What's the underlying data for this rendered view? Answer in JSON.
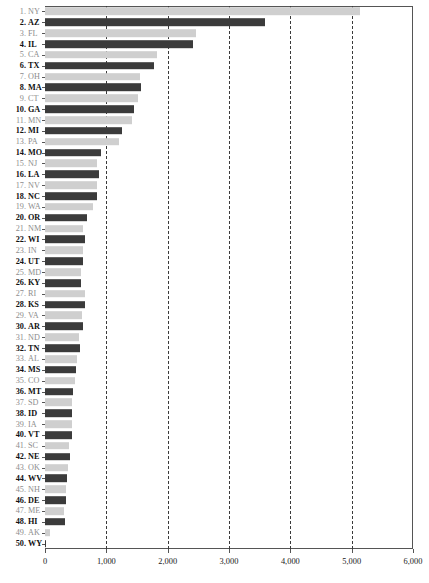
{
  "chart_data": {
    "type": "bar",
    "orientation": "horizontal",
    "title": "",
    "xlabel": "",
    "ylabel": "",
    "xlim": [
      0,
      6000
    ],
    "grid": true,
    "legend": null,
    "xticks": [
      0,
      1000,
      2000,
      3000,
      4000,
      5000,
      6000
    ],
    "xticklabels": [
      "0",
      "1,000",
      "2,000",
      "3,000",
      "4,000",
      "5,000",
      "6,000"
    ],
    "colors": {
      "dark_bar": "#3b3b3b",
      "light_bar": "#cfcfcf",
      "gridline": "#3a3a3a",
      "axis": "#555555",
      "bold_label": "#111111",
      "faint_label": "#8d8d8d"
    },
    "categories": [
      "NY",
      "AZ",
      "FL",
      "IL",
      "CA",
      "TX",
      "OH",
      "MA",
      "CT",
      "GA",
      "MN",
      "MI",
      "PA",
      "MO",
      "NJ",
      "LA",
      "NV",
      "NC",
      "WA",
      "OR",
      "NM",
      "WI",
      "IN",
      "UT",
      "MD",
      "KY",
      "RI",
      "KS",
      "VA",
      "AR",
      "ND",
      "TN",
      "AL",
      "MS",
      "CO",
      "MT",
      "SD",
      "ID",
      "IA",
      "VT",
      "SC",
      "NE",
      "OK",
      "WV",
      "NH",
      "DE",
      "ME",
      "HI",
      "AK",
      "WY"
    ],
    "ranks": [
      "1.",
      "2.",
      "3.",
      "4.",
      "5.",
      "6.",
      "7.",
      "8.",
      "9.",
      "10.",
      "11.",
      "12.",
      "13.",
      "14.",
      "15.",
      "16.",
      "17.",
      "18.",
      "19.",
      "20.",
      "21.",
      "22.",
      "23.",
      "24.",
      "25.",
      "26.",
      "27.",
      "28.",
      "29.",
      "30.",
      "31.",
      "32.",
      "33.",
      "34.",
      "35.",
      "36.",
      "37.",
      "38.",
      "39.",
      "40.",
      "41.",
      "42.",
      "43.",
      "44.",
      "45.",
      "46.",
      "47.",
      "48.",
      "49.",
      "50."
    ],
    "values": [
      5140,
      3590,
      2460,
      2420,
      1820,
      1770,
      1545,
      1565,
      1510,
      1450,
      1420,
      1250,
      1210,
      915,
      855,
      885,
      845,
      845,
      790,
      685,
      625,
      655,
      615,
      615,
      585,
      585,
      655,
      645,
      600,
      615,
      560,
      570,
      525,
      505,
      490,
      460,
      440,
      445,
      440,
      440,
      395,
      410,
      380,
      365,
      345,
      345,
      310,
      325,
      80,
      20
    ],
    "bar_styles": [
      "light",
      "dark",
      "light",
      "dark",
      "light",
      "dark",
      "light",
      "dark",
      "light",
      "dark",
      "light",
      "dark",
      "light",
      "dark",
      "light",
      "dark",
      "light",
      "dark",
      "light",
      "dark",
      "light",
      "dark",
      "light",
      "dark",
      "light",
      "dark",
      "light",
      "dark",
      "light",
      "dark",
      "light",
      "dark",
      "light",
      "dark",
      "light",
      "dark",
      "light",
      "dark",
      "light",
      "dark",
      "light",
      "dark",
      "light",
      "dark",
      "light",
      "dark",
      "light",
      "dark",
      "light",
      "dark"
    ]
  }
}
